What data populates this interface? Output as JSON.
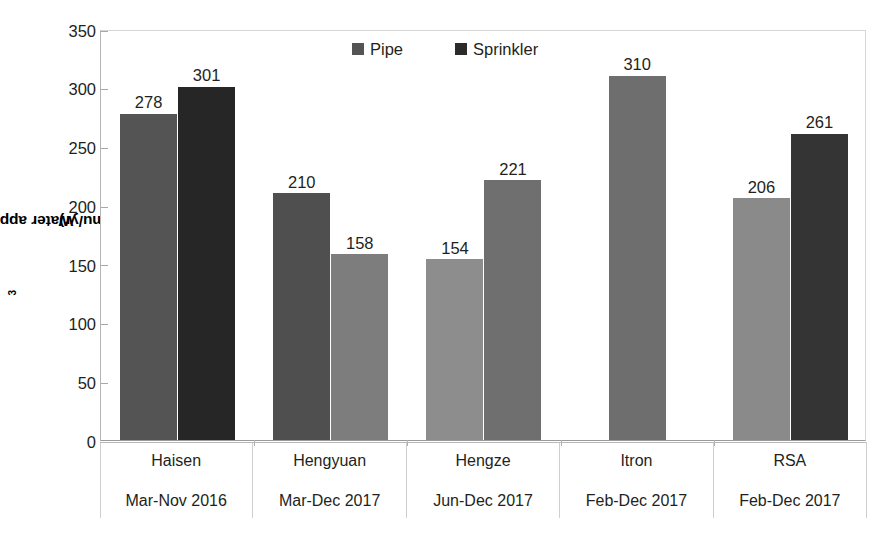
{
  "chart_data": {
    "type": "bar",
    "title": "",
    "xlabel": "",
    "ylabel": "Water application (m3/mu/yr)",
    "ylabel_prefix": "Water application (m",
    "ylabel_sup": "3",
    "ylabel_suffix": "/mu/yr)",
    "ylim": [
      0,
      350
    ],
    "ytick_values": [
      350,
      300,
      250,
      200,
      150,
      100,
      50,
      0
    ],
    "ytick_labels": [
      "350",
      "300",
      "250",
      "200",
      "150",
      "100",
      "50",
      "0"
    ],
    "grid": false,
    "legend_position": "top-center",
    "categories": [
      "Haisen",
      "Hengyuan",
      "Hengze",
      "Itron",
      "RSA"
    ],
    "category_periods": [
      "Mar-Nov 2016",
      "Mar-Dec 2017",
      "Jun-Dec 2017",
      "Feb-Dec 2017",
      "Feb-Dec 2017"
    ],
    "series": [
      {
        "name": "Pipe",
        "color": "#545454",
        "values": [
          278,
          210,
          154,
          310,
          206
        ],
        "labels": [
          "278",
          "210",
          "154",
          "310",
          "206"
        ],
        "bar_colors": [
          "#545454",
          "#4f4f4f",
          "#8d8d8d",
          "#6e6e6e",
          "#8a8a8a"
        ]
      },
      {
        "name": "Sprinkler",
        "color": "#2b2b2b",
        "values": [
          301,
          158,
          221,
          null,
          261
        ],
        "labels": [
          "301",
          "158",
          "221",
          "",
          "261"
        ],
        "bar_colors": [
          "#262626",
          "#7d7d7d",
          "#6f6f6f",
          null,
          "#343434"
        ]
      }
    ],
    "legend": [
      {
        "label": "Pipe",
        "color": "#545454"
      },
      {
        "label": "Sprinkler",
        "color": "#2b2b2b"
      }
    ]
  },
  "axis": {
    "y_title": "Water application (m3/mu/yr)"
  }
}
